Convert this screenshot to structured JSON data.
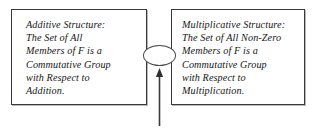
{
  "diagram": {
    "boxes": [
      {
        "name": "additive-structure",
        "heading": "Additive Structure:",
        "lines": [
          "Additive Structure:",
          "The Set of All",
          "Members of F is a",
          "Commutative Group",
          "with Respect to",
          "Addition."
        ]
      },
      {
        "name": "multiplicative-structure",
        "heading": "Multiplicative Structure:",
        "lines": [
          "Multiplicative Structure:",
          "The Set of All Non-Zero",
          "Members of F is a",
          "Commutative Group",
          "with Respect to",
          "Multiplication."
        ]
      }
    ],
    "connector": {
      "ellipse_label": "",
      "arrow_label": "",
      "arrow_direction": "up"
    },
    "colors": {
      "border": "#3a3a3a",
      "text": "#161616",
      "background": "#ffffff",
      "shadow": "#b8b8b8",
      "connector_stroke": "#4a4a4a"
    }
  }
}
